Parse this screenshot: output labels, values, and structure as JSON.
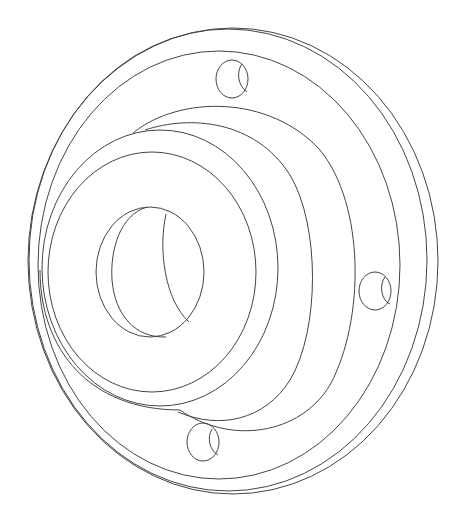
{
  "figure": {
    "background": "#ffffff",
    "line_color": "#444444",
    "bolt_hole_count": 3
  }
}
